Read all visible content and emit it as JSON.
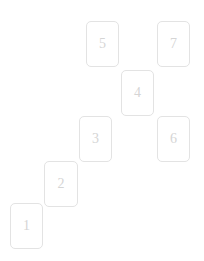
{
  "board": {
    "name": "card-staircase-board",
    "background_color": "#ffffff",
    "width": 204,
    "height": 261
  },
  "card_style": {
    "width": 33,
    "height": 46,
    "border_color": "#e3e3e3",
    "border_radius": 5,
    "fill_color": "#ffffff",
    "label_color": "#d5d5d5",
    "label_font_size": 14
  },
  "cards": [
    {
      "label": "1",
      "x": 10,
      "y": 203,
      "width": 33,
      "height": 46
    },
    {
      "label": "2",
      "x": 44,
      "y": 161,
      "width": 34,
      "height": 46
    },
    {
      "label": "3",
      "x": 79,
      "y": 116,
      "width": 33,
      "height": 46
    },
    {
      "label": "4",
      "x": 121,
      "y": 70,
      "width": 33,
      "height": 46
    },
    {
      "label": "5",
      "x": 86,
      "y": 21,
      "width": 33,
      "height": 46
    },
    {
      "label": "6",
      "x": 157,
      "y": 116,
      "width": 33,
      "height": 46
    },
    {
      "label": "7",
      "x": 157,
      "y": 21,
      "width": 33,
      "height": 46
    }
  ]
}
